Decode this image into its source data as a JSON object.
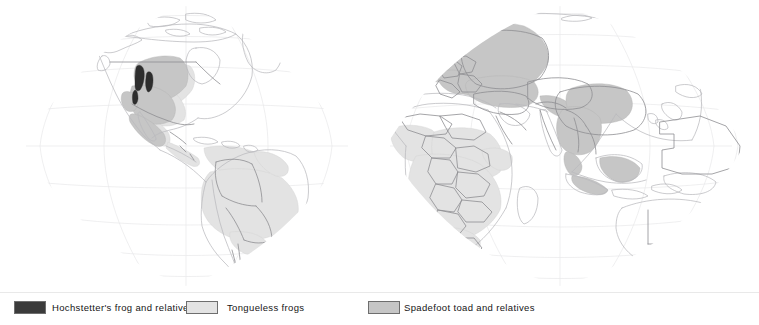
{
  "figure": {
    "type": "distribution-map",
    "projection": "interrupted-oval (orange-peel) world projection, two lobes",
    "background_color": "#ffffff"
  },
  "legend": {
    "divider_color": "#e9e9e9",
    "items": [
      {
        "id": "hochstetters-frog",
        "label": "Hochstetter's frog and relatives",
        "swatch_fill": "#3b3b3b",
        "swatch_border": "#6e6e6e"
      },
      {
        "id": "tongueless-frogs",
        "label": "Tongueless frogs",
        "swatch_fill": "#e3e3e3",
        "swatch_border": "#6e6e6e"
      },
      {
        "id": "spadefoot-toad",
        "label": "Spadefoot toad and relatives",
        "swatch_fill": "#c6c6c6",
        "swatch_border": "#6e6e6e"
      }
    ]
  },
  "map": {
    "graticule_color": "#e8e8ea",
    "coastline_color": "#b9b9bd",
    "border_color": "#8e8e92",
    "ranges": {
      "hochstetters_fill": "#2e2e2e",
      "tongueless_fill": "#e3e3e3",
      "spadefoot_fill": "#c6c6c6"
    },
    "range_regions": {
      "hochstetters_frog": [
        "Pacific Northwest / Cascade Range, western North America",
        "Sierra Nevada, California",
        "North Island, New Zealand"
      ],
      "tongueless_frogs": [
        "Sub-Saharan Africa",
        "Tropical South America (Amazon Basin, Guianas, Brazil)",
        "Central America and Mexico",
        "Southeastern United States"
      ],
      "spadefoot_toad_and_relatives": [
        "Europe and western Russia",
        "Iberian Peninsula and Northwest Africa",
        "Anatolia and the Caucasus",
        "Southern China and Indochina",
        "Himalayan foothills",
        "Borneo and the Greater Sunda Islands",
        "Western and south-central United States",
        "Mexico"
      ]
    }
  }
}
